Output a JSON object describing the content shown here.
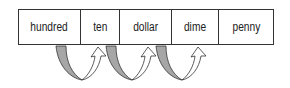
{
  "place_values": [
    "hundred",
    "ten",
    "dollar",
    "dime",
    "penny"
  ],
  "cell_widths": [
    62,
    40,
    52,
    48,
    54
  ],
  "arrows": [
    {
      "from": "hundred",
      "to": "ten"
    },
    {
      "from": "ten",
      "to": "dollar"
    },
    {
      "from": "dollar",
      "to": "dime"
    }
  ],
  "colors": {
    "down_arrow_fill": "#a6a6a6",
    "stroke": "#333333",
    "up_arrow_fill": "#ffffff"
  }
}
